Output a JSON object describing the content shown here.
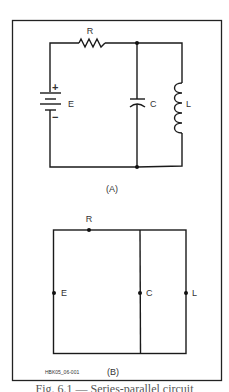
{
  "figure_id": "HBK05_06-001",
  "diagram_a": {
    "caption": "(A)",
    "components": {
      "resistor": "R",
      "battery": "E",
      "battery_plus": "+",
      "battery_minus": "−",
      "capacitor": "C",
      "inductor": "L"
    }
  },
  "diagram_b": {
    "caption": "(B)",
    "nodes": {
      "resistor": "R",
      "battery": "E",
      "capacitor": "C",
      "inductor": "L"
    }
  },
  "cutoff_caption": "Fig. 6.1 — Series-parallel circuit"
}
